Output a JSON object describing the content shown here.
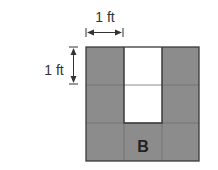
{
  "figure": {
    "width_label": "1 ft",
    "height_label": "1 ft",
    "shape_label": "B",
    "grid": {
      "rows": 3,
      "cols": 3,
      "cells": [
        [
          "filled",
          "empty",
          "filled"
        ],
        [
          "filled",
          "empty",
          "filled"
        ],
        [
          "filled",
          "filled",
          "filled"
        ]
      ]
    },
    "colors": {
      "filled": "#8c8c8c",
      "empty": "#ffffff",
      "border": "#3a3a3a",
      "gridline": "#6e6e6e",
      "text": "#333333"
    }
  }
}
